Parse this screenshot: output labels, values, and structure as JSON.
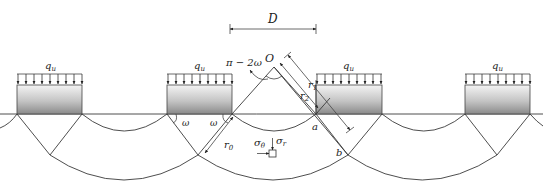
{
  "figure": {
    "type": "geotechnical-failure-mechanism",
    "colors": {
      "line": "#3a3a3a",
      "footing_gradient_top": "#f2f2f2",
      "footing_gradient_bottom": "#8a8a8a",
      "background": "#ffffff"
    }
  },
  "footings": [
    {
      "id": "footing-1",
      "load_label": "q",
      "load_sub": "u"
    },
    {
      "id": "footing-2",
      "load_label": "q",
      "load_sub": "u"
    },
    {
      "id": "footing-3",
      "load_label": "q",
      "load_sub": "u"
    },
    {
      "id": "footing-4",
      "load_label": "q",
      "load_sub": "u"
    }
  ],
  "labels": {
    "spacing": "D",
    "center": "O",
    "fan_angle": "π − 2ω",
    "omega_left": "ω",
    "omega_right": "ω",
    "r1_main": "r",
    "r1_sub": "1",
    "r2_main": "r",
    "r2_sub": "2",
    "r0_main": "r",
    "r0_sub": "0",
    "point_a": "a",
    "point_b": "b",
    "sigma_theta_main": "σ",
    "sigma_theta_sub": "θ",
    "sigma_r_main": "σ",
    "sigma_r_sub": "r"
  }
}
